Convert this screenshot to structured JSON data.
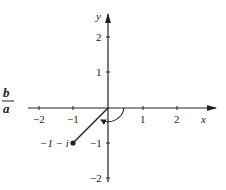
{
  "diagram": {
    "type": "complex-plane",
    "axes": {
      "x_label": "x",
      "y_label": "y",
      "x_ticks": [
        "−2",
        "−1",
        "1",
        "2"
      ],
      "y_ticks": [
        "2",
        "1",
        "−1",
        "−2"
      ]
    },
    "point": {
      "label": "−1 − i",
      "x": -1,
      "y": -1
    },
    "fraction": {
      "numerator": "b",
      "denominator": "a"
    }
  }
}
